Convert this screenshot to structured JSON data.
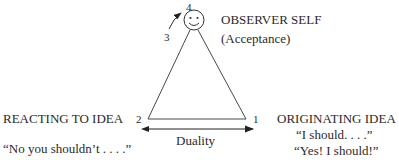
{
  "diagram": {
    "observer": {
      "title": "OBSERVER SELF",
      "subtitle": "(Acceptance)",
      "icon": "smiley-face-icon"
    },
    "vertices": {
      "v1": "1",
      "v2": "2",
      "v3": "3",
      "v4": "4"
    },
    "left": {
      "title": "REACTING TO IDEA",
      "quote": "“No you shouldn’t . . . .”"
    },
    "right": {
      "title": "ORIGINATING IDEA",
      "quote1": "“I should. . . .”",
      "quote2": "“Yes! I should!”"
    },
    "base": {
      "label": "Duality"
    },
    "colors": {
      "ink": "#2a2a2a",
      "background": "#ffffff"
    }
  }
}
